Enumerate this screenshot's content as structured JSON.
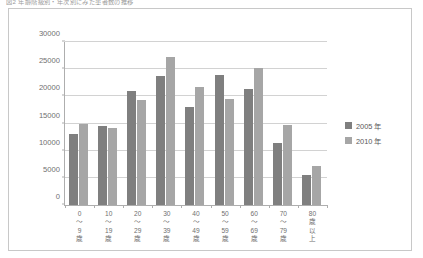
{
  "caption": {
    "text": "図2   年齢階級別・年次別にみた患者数の推移"
  },
  "legend": {
    "position": "right",
    "items": [
      {
        "label": "2005 年",
        "color": "#7f7f7f"
      },
      {
        "label": "2010 年",
        "color": "#a6a6a6"
      }
    ]
  },
  "axes": {
    "y_ticks": [
      "0",
      "5000",
      "10000",
      "15000",
      "20000",
      "25000",
      "30000"
    ],
    "x_tick_labels": [
      [
        "0",
        "〜",
        "9",
        "歳"
      ],
      [
        "10",
        "〜",
        "19",
        "歳"
      ],
      [
        "20",
        "〜",
        "29",
        "歳"
      ],
      [
        "30",
        "〜",
        "39",
        "歳"
      ],
      [
        "40",
        "〜",
        "49",
        "歳"
      ],
      [
        "50",
        "〜",
        "59",
        "歳"
      ],
      [
        "60",
        "〜",
        "69",
        "歳"
      ],
      [
        "70",
        "〜",
        "79",
        "歳"
      ],
      [
        "80",
        "歳",
        "以",
        "上"
      ]
    ]
  },
  "chart_data": {
    "type": "bar",
    "title": "",
    "xlabel": "",
    "ylabel": "",
    "ylim": [
      0,
      30000
    ],
    "ytick_step": 5000,
    "grid": true,
    "legend_position": "right",
    "categories": [
      "0〜9歳",
      "10〜19歳",
      "20〜29歳",
      "30〜39歳",
      "40〜49歳",
      "50〜59歳",
      "60〜69歳",
      "70〜79歳",
      "80歳以上"
    ],
    "series": [
      {
        "name": "2005 年",
        "color": "#7f7f7f",
        "values": [
          13000,
          14500,
          21000,
          23700,
          18000,
          24000,
          21300,
          11500,
          5500
        ]
      },
      {
        "name": "2010 年",
        "color": "#a6a6a6",
        "values": [
          15000,
          14200,
          19400,
          27200,
          21800,
          19500,
          25200,
          14700,
          7200
        ]
      }
    ]
  }
}
